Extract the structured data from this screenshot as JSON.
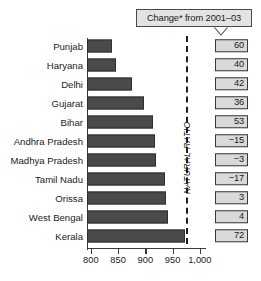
{
  "callout": {
    "label": "Change* from 2001–03",
    "tail_icon": "chevron-down-icon"
  },
  "natural_ratio": {
    "label": "NATURAL RATIO",
    "value": 975
  },
  "chart_data": {
    "type": "bar",
    "orientation": "horizontal",
    "title": "",
    "xlabel": "",
    "ylabel": "",
    "xlim": [
      770,
      1010
    ],
    "grid": false,
    "legend": null,
    "categories": [
      "Punjab",
      "Haryana",
      "Delhi",
      "Gujarat",
      "Bihar",
      "Andhra Pradesh",
      "Madhya Pradesh",
      "Tamil Nadu",
      "Orissa",
      "West Bengal",
      "Kerala"
    ],
    "values": [
      838,
      846,
      876,
      898,
      914,
      917,
      920,
      937,
      938,
      941,
      972
    ],
    "change_values": [
      "60",
      "40",
      "42",
      "36",
      "53",
      "−15",
      "−3",
      "−17",
      "3",
      "4",
      "72"
    ],
    "xticks": [
      800,
      850,
      900,
      950,
      1000
    ],
    "xticklabels": [
      "800",
      "850",
      "900",
      "950",
      "1,000"
    ],
    "annotations": [
      {
        "type": "vline",
        "label": "NATURAL RATIO",
        "value": 975
      }
    ]
  },
  "colors": {
    "bar": "#4a4a4a",
    "box_fill": "#d9d9d9",
    "callout_fill": "#e3e3e3",
    "line": "#3a3a3a",
    "text": "#1a1a1a"
  }
}
